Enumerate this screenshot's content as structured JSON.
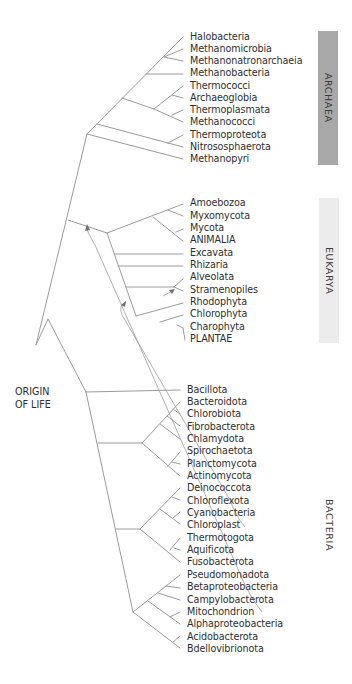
{
  "diagram": {
    "type": "phylogenetic-tree",
    "root_label": [
      "ORIGIN",
      "OF LIFE"
    ],
    "line_color": "#9a9a9a",
    "domains": [
      {
        "name": "ARCHAEA",
        "box_color": "#a8a8a8",
        "taxa": [
          "Halobacteria",
          "Methanomicrobia",
          "Methanonatronarchaeia",
          "Methanobacteria",
          "Thermococci",
          "Archaeoglobia",
          "Thermoplasmata",
          "Methanococci",
          "Thermoproteota",
          "Nitrososphaerota",
          "Methanopyri"
        ]
      },
      {
        "name": "EUKARYA",
        "box_color": "#ececec",
        "taxa": [
          "Amoebozoa",
          "Myxomycota",
          "Mycota",
          "ANIMALIA",
          "Excavata",
          "Rhizaria",
          "Alveolata",
          "Stramenopiles",
          "Rhodophyta",
          "Chlorophyta",
          "Charophyta",
          "PLANTAE"
        ]
      },
      {
        "name": "BACTERIA",
        "box_color": "#ffffff",
        "taxa": [
          "Bacillota",
          "Bacteroidota",
          "Chlorobiota",
          "Fibrobacterota",
          "Chlamydota",
          "Spirochaetota",
          "Planctomycota",
          "Actinomycota",
          "Deinococcota",
          "Chloroflexota",
          "Cyanobacteria",
          "Chloroplast",
          "Thermotogota",
          "Aquificota",
          "Fusobacterota",
          "Pseudomonadota",
          "Betaproteobacteria",
          "Campylobacterota",
          "Mitochondrion",
          "Alphaproteobacteria",
          "Acidobacterota",
          "Bdellovibrionota"
        ]
      }
    ],
    "endosymbiosis_links": [
      {
        "from": "Mitochondrion",
        "to": "Eukarya stem"
      },
      {
        "from": "Chloroplast",
        "to": "Plantae/Rhodophyta stem"
      },
      {
        "from": "Plastid (secondary)",
        "to": "Alveolata/Stramenopiles"
      }
    ]
  }
}
